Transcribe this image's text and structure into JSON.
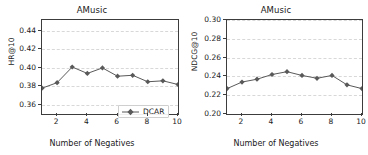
{
  "figure": {
    "background": "#ffffff",
    "series_color": "#595959",
    "grid_color": "#d8d8d8",
    "axis_color": "#3c3c3c"
  },
  "panels": [
    {
      "id": "left",
      "chart_data": {
        "type": "line",
        "title": "AMusic",
        "xlabel": "Number of Negatives",
        "ylabel": "HR@10",
        "x": [
          1,
          2,
          3,
          4,
          5,
          6,
          7,
          8,
          9,
          10
        ],
        "xlim": [
          1,
          10
        ],
        "ylim": [
          0.35,
          0.452
        ],
        "xticks": [
          2,
          4,
          6,
          8,
          10
        ],
        "xticklabels": [
          "2",
          "4",
          "6",
          "8",
          "10"
        ],
        "yticks": [
          0.36,
          0.38,
          0.4,
          0.42,
          0.44
        ],
        "yticklabels": [
          "0.36",
          "0.38",
          "0.40",
          "0.42",
          "0.44"
        ],
        "grid": true,
        "legend_position": "lower right",
        "marker": "diamond",
        "series": [
          {
            "name": "DCAR",
            "values": [
              0.378,
              0.384,
              0.401,
              0.394,
              0.4,
              0.391,
              0.392,
              0.385,
              0.386,
              0.382
            ]
          }
        ]
      }
    },
    {
      "id": "right",
      "chart_data": {
        "type": "line",
        "title": "AMusic",
        "xlabel": "Number of Negatives",
        "ylabel": "NDCG@10",
        "x": [
          1,
          2,
          3,
          4,
          5,
          6,
          7,
          8,
          9,
          10
        ],
        "xlim": [
          1,
          10
        ],
        "ylim": [
          0.2,
          0.3
        ],
        "xticks": [
          2,
          4,
          6,
          8,
          10
        ],
        "xticklabels": [
          "2",
          "4",
          "6",
          "8",
          "10"
        ],
        "yticks": [
          0.2,
          0.22,
          0.24,
          0.26,
          0.28,
          0.3
        ],
        "yticklabels": [
          "0.20",
          "0.22",
          "0.24",
          "0.26",
          "0.28",
          "0.30"
        ],
        "grid": true,
        "legend_position": "lower right",
        "marker": "diamond",
        "series": [
          {
            "name": "DCAR",
            "values": [
              0.227,
              0.234,
              0.237,
              0.242,
              0.245,
              0.241,
              0.238,
              0.241,
              0.231,
              0.227
            ]
          }
        ]
      }
    }
  ]
}
